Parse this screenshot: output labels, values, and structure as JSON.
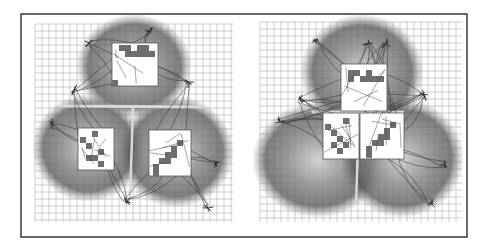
{
  "figure": {
    "width": 488,
    "height": 249,
    "frame": {
      "x": 21,
      "y": 14,
      "w": 446,
      "h": 223,
      "stroke": "#444444",
      "stroke_width": 1.6
    },
    "colors": {
      "background": "#ffffff",
      "grid": "#b8b8b8",
      "blob_dark": "#4a4a4a",
      "blob_mid": "#8a8a8a",
      "box_fill": "#ffffff",
      "box_stroke": "#555555",
      "cell_fill": "#6e6e6e",
      "strand": "#333333"
    },
    "panels": [
      {
        "id": "left",
        "grid": {
          "x": 35,
          "y": 24,
          "w": 198,
          "h": 198,
          "step": 7
        },
        "blobs": [
          {
            "cx": 134,
            "cy": 66,
            "rx": 58,
            "ry": 52
          },
          {
            "cx": 88,
            "cy": 148,
            "rx": 56,
            "ry": 54
          },
          {
            "cx": 176,
            "cy": 152,
            "rx": 58,
            "ry": 56
          }
        ],
        "seam": {
          "h": {
            "x1": 60,
            "y1": 106,
            "x2": 205,
            "y2": 107
          },
          "v": {
            "x1": 133,
            "y1": 108,
            "x2": 130,
            "y2": 200
          }
        },
        "boxes": [
          {
            "x": 112,
            "y": 43,
            "w": 46,
            "h": 43,
            "cells": [
              [
                119,
                45
              ],
              [
                125,
                45
              ],
              [
                125,
                51
              ],
              [
                131,
                51
              ],
              [
                137,
                51
              ],
              [
                143,
                51
              ],
              [
                137,
                45
              ],
              [
                143,
                45
              ],
              [
                149,
                51
              ],
              [
                112,
                80
              ]
            ]
          },
          {
            "x": 78,
            "y": 128,
            "w": 36,
            "h": 42,
            "cells": [
              [
                80,
                137
              ],
              [
                86,
                143
              ],
              [
                92,
                131
              ],
              [
                98,
                149
              ],
              [
                92,
                155
              ],
              [
                98,
                161
              ],
              [
                86,
                155
              ]
            ]
          },
          {
            "x": 149,
            "y": 130,
            "w": 42,
            "h": 46,
            "cells": [
              [
                177,
                140
              ],
              [
                171,
                146
              ],
              [
                165,
                152
              ],
              [
                159,
                158
              ],
              [
                153,
                164
              ],
              [
                165,
                158
              ],
              [
                171,
                152
              ],
              [
                153,
                170
              ]
            ]
          }
        ],
        "tufts": [
          {
            "x": 89,
            "y": 43
          },
          {
            "x": 188,
            "y": 82
          },
          {
            "x": 52,
            "y": 124
          },
          {
            "x": 216,
            "y": 162
          },
          {
            "x": 126,
            "y": 202
          },
          {
            "x": 208,
            "y": 208
          },
          {
            "x": 74,
            "y": 90
          },
          {
            "x": 150,
            "y": 32
          }
        ]
      },
      {
        "id": "right",
        "grid": {
          "x": 260,
          "y": 22,
          "w": 202,
          "h": 200,
          "step": 7
        },
        "blobs": [
          {
            "cx": 362,
            "cy": 72,
            "rx": 62,
            "ry": 58
          },
          {
            "cx": 318,
            "cy": 160,
            "rx": 66,
            "ry": 58
          },
          {
            "cx": 402,
            "cy": 158,
            "rx": 62,
            "ry": 60
          }
        ],
        "seam": {
          "h": {
            "x1": 312,
            "y1": 112,
            "x2": 404,
            "y2": 112
          },
          "v": {
            "x1": 359,
            "y1": 112,
            "x2": 356,
            "y2": 205
          }
        },
        "boxes": [
          {
            "x": 341,
            "y": 64,
            "w": 46,
            "h": 47,
            "cells": [
              [
                348,
                70
              ],
              [
                354,
                70
              ],
              [
                348,
                76
              ],
              [
                360,
                76
              ],
              [
                366,
                76
              ],
              [
                372,
                76
              ],
              [
                366,
                70
              ],
              [
                378,
                76
              ]
            ]
          },
          {
            "x": 323,
            "y": 113,
            "w": 36,
            "h": 46,
            "cells": [
              [
                325,
                124
              ],
              [
                331,
                130
              ],
              [
                343,
                118
              ],
              [
                337,
                136
              ],
              [
                343,
                142
              ],
              [
                337,
                148
              ],
              [
                331,
                142
              ]
            ]
          },
          {
            "x": 360,
            "y": 113,
            "w": 44,
            "h": 46,
            "cells": [
              [
                390,
                122
              ],
              [
                384,
                128
              ],
              [
                378,
                134
              ],
              [
                372,
                140
              ],
              [
                366,
                146
              ],
              [
                384,
                134
              ],
              [
                378,
                140
              ],
              [
                366,
                152
              ]
            ]
          }
        ],
        "tufts": [
          {
            "x": 314,
            "y": 40
          },
          {
            "x": 424,
            "y": 95
          },
          {
            "x": 280,
            "y": 122
          },
          {
            "x": 444,
            "y": 165
          },
          {
            "x": 432,
            "y": 204
          },
          {
            "x": 368,
            "y": 44
          },
          {
            "x": 386,
            "y": 44
          },
          {
            "x": 300,
            "y": 100
          }
        ]
      }
    ]
  }
}
